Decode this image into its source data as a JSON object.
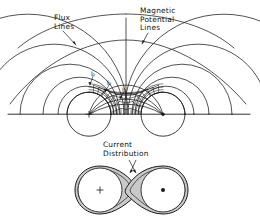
{
  "figure": {
    "title_labels": {
      "flux": "Flux\nLines",
      "potential": "Magnetic\nPotential\nLines",
      "current": "Current\nDistribution"
    },
    "current_element_labels": [
      "I₁",
      "I₂",
      "I₃"
    ],
    "conductors": {
      "left": {
        "symbol": "+",
        "center_x": 89,
        "center_y": 114,
        "radius": 22,
        "polarity": "into-page"
      },
      "right": {
        "symbol": "●",
        "center_x": 163,
        "center_y": 114,
        "radius": 22,
        "polarity": "out-of-page"
      }
    },
    "current_distribution": {
      "left": {
        "symbol": "+",
        "center_x": 100,
        "center_y": 190,
        "radius": 22
      },
      "right": {
        "symbol": "●",
        "center_x": 163,
        "center_y": 190,
        "radius": 22
      },
      "shading": "#c9c9c9"
    },
    "axis": {
      "y": 114,
      "x_start": 8,
      "x_end": 250
    },
    "colors": {
      "background": "#ffffff",
      "line": "#1a1a1a",
      "shade": "#c9c9c9",
      "text": "#111111"
    }
  }
}
